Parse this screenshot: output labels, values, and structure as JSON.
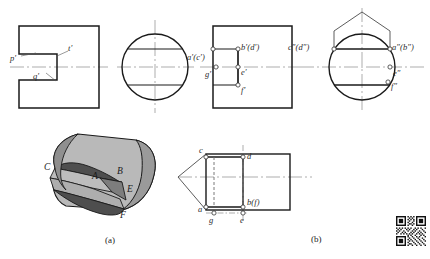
{
  "figure": {
    "captions": [
      {
        "id": "caption-a",
        "text": "(a)"
      },
      {
        "id": "caption-b",
        "text": "(b)"
      }
    ]
  },
  "views": {
    "front_view_left": {
      "name": "front-view-notched-profile",
      "labels": [
        {
          "id": "p-prime",
          "text": "p′",
          "x": 16,
          "y": 59
        },
        {
          "id": "q-prime",
          "text": "q′",
          "x": 36,
          "y": 76
        },
        {
          "id": "t-prime",
          "text": "t′",
          "x": 68,
          "y": 49
        }
      ]
    },
    "circle_view": {
      "name": "side-view-circle",
      "labels": []
    },
    "front_view_labeled": {
      "name": "front-view-labeled-points",
      "labels": [
        {
          "id": "a-prime-c-prime",
          "text": "a′(c′)",
          "x": 200,
          "y": 58
        },
        {
          "id": "b-prime-d-prime",
          "text": "b′(d′)",
          "x": 239,
          "y": 50
        },
        {
          "id": "g-prime",
          "text": "g′",
          "x": 209,
          "y": 71
        },
        {
          "id": "e-prime",
          "text": "e′",
          "x": 241,
          "y": 71
        },
        {
          "id": "f-prime",
          "text": "f′",
          "x": 241,
          "y": 85
        }
      ]
    },
    "side_view_labeled": {
      "name": "side-view-labeled-points",
      "labels": [
        {
          "id": "c-dprime-d-dprime",
          "text": "c″(d″)",
          "x": 288,
          "y": 45
        },
        {
          "id": "a-dprime-b-dprime",
          "text": "a″(b″)",
          "x": 388,
          "y": 45
        },
        {
          "id": "e-dprime",
          "text": "e″",
          "x": 389,
          "y": 72
        },
        {
          "id": "f-dprime",
          "text": "f″",
          "x": 389,
          "y": 83
        }
      ]
    },
    "isometric_view": {
      "name": "isometric-slotted-cylinder",
      "labels": [
        {
          "id": "point-C",
          "text": "C",
          "x": 46,
          "y": 168
        },
        {
          "id": "point-A",
          "text": "A",
          "x": 92,
          "y": 177
        },
        {
          "id": "point-B",
          "text": "B",
          "x": 117,
          "y": 172
        },
        {
          "id": "point-E",
          "text": "E",
          "x": 126,
          "y": 189
        },
        {
          "id": "point-F",
          "text": "F",
          "x": 121,
          "y": 215
        }
      ]
    },
    "top_view_labeled": {
      "name": "top-view-labeled-points",
      "labels": [
        {
          "id": "point-c",
          "text": "c",
          "x": 202,
          "y": 148
        },
        {
          "id": "point-d",
          "text": "d",
          "x": 247,
          "y": 153
        },
        {
          "id": "point-a",
          "text": "a",
          "x": 201,
          "y": 207
        },
        {
          "id": "point-g",
          "text": "g",
          "x": 209,
          "y": 216
        },
        {
          "id": "point-b-f",
          "text": "b(f)",
          "x": 245,
          "y": 200
        },
        {
          "id": "point-e",
          "text": "e",
          "x": 239,
          "y": 216
        }
      ]
    }
  },
  "colors": {
    "outline": "#1a1a1a",
    "thin_line": "#4a4a4a",
    "center_line": "#8a8a8a",
    "hidden_line": "#6b6b6b",
    "solid_light": "#b9b9b9",
    "solid_mid": "#9a9a9a",
    "solid_dark": "#5e5e5e",
    "background": "#ffffff"
  },
  "qr_code": {
    "name": "qr-code",
    "alt": "qr-code"
  }
}
